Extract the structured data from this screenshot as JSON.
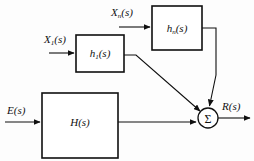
{
  "diagram": {
    "background_color": "#fdfdfd",
    "line_color": "#101010",
    "blocks": [
      {
        "id": "h1",
        "label_base": "h",
        "label_sub": "1",
        "label_tail": "(s)",
        "x": 76,
        "y": 35,
        "width": 48,
        "height": 37
      },
      {
        "id": "hn",
        "label_base": "h",
        "label_sub": "n",
        "label_tail": "(s)",
        "x": 152,
        "y": 6,
        "width": 50,
        "height": 44
      },
      {
        "id": "H",
        "label_base": "H",
        "label_sub": "",
        "label_tail": "(s)",
        "x": 42,
        "y": 93,
        "width": 76,
        "height": 65
      }
    ],
    "summing_junction": {
      "id": "sigma",
      "glyph": "Σ",
      "glyph_name": "sigma-symbol",
      "cx": 208,
      "cy": 118,
      "r": 10
    },
    "signals": [
      {
        "id": "x1",
        "label_base": "X",
        "label_sub": "1",
        "label_tail": "(s)",
        "label_x": 44,
        "label_y": 43,
        "description": "input to h1(s)"
      },
      {
        "id": "xn",
        "label_base": "X",
        "label_sub": "n",
        "label_tail": "(s)",
        "label_x": 111,
        "label_y": 16,
        "description": "input to hn(s)"
      },
      {
        "id": "e",
        "label_base": "E",
        "label_sub": "",
        "label_tail": "(s)",
        "label_x": 7,
        "label_y": 114,
        "description": "input to H(s)"
      },
      {
        "id": "r",
        "label_base": "R",
        "label_sub": "",
        "label_tail": "(s)",
        "label_x": 222,
        "label_y": 110,
        "description": "output from summing junction"
      }
    ]
  }
}
